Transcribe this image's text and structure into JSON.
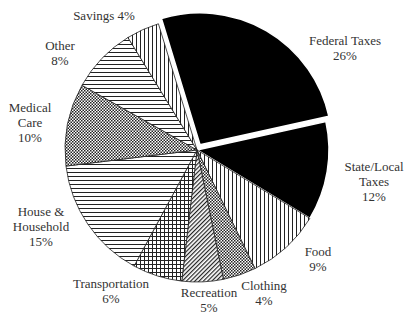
{
  "chart_data": {
    "type": "pie",
    "title": "",
    "start_angle_deg": -17,
    "direction": "clockwise",
    "slices": [
      {
        "label": "Federal Taxes",
        "value": 26,
        "pattern": "solid-black",
        "exploded": true
      },
      {
        "label": "State/Local Taxes",
        "value": 12,
        "pattern": "solid-black",
        "exploded": false
      },
      {
        "label": "Food",
        "value": 9,
        "pattern": "vertical-lines",
        "exploded": false
      },
      {
        "label": "Clothing",
        "value": 4,
        "pattern": "checker",
        "exploded": false
      },
      {
        "label": "Recreation",
        "value": 5,
        "pattern": "diagonal-lines",
        "exploded": false
      },
      {
        "label": "Transportation",
        "value": 6,
        "pattern": "grid",
        "exploded": false
      },
      {
        "label": "House & Household",
        "value": 15,
        "pattern": "horizontal-lines",
        "exploded": false
      },
      {
        "label": "Medical Care",
        "value": 10,
        "pattern": "checker",
        "exploded": false
      },
      {
        "label": "Other",
        "value": 8,
        "pattern": "horizontal-lines",
        "exploded": false
      },
      {
        "label": "Savings",
        "value": 4,
        "pattern": "vertical-lines",
        "exploded": false
      }
    ],
    "unit": "%"
  },
  "labels": {
    "federal": {
      "line1": "Federal Taxes",
      "line2": "26%"
    },
    "state": {
      "line1": "State/Local",
      "line2": "Taxes",
      "line3": "12%"
    },
    "food": {
      "line1": "Food",
      "line2": "9%"
    },
    "clothing": {
      "line1": "Clothing",
      "line2": "4%"
    },
    "recreation": {
      "line1": "Recreation",
      "line2": "5%"
    },
    "transportation": {
      "line1": "Transportation",
      "line2": "6%"
    },
    "house": {
      "line1": "House &",
      "line2": "Household",
      "line3": "15%"
    },
    "medical": {
      "line1": "Medical",
      "line2": "Care",
      "line3": "10%"
    },
    "other": {
      "line1": "Other",
      "line2": "8%"
    },
    "savings": {
      "line1": "Savings 4%"
    }
  }
}
